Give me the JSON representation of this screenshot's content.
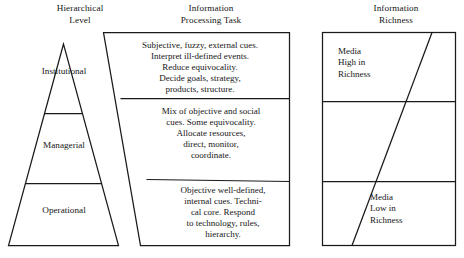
{
  "figure": {
    "columns": {
      "hierarchical_level": "Hierarchical\nLevel",
      "information_processing_task": "Information\nProcessing Task",
      "information_richness": "Information\nRichness"
    },
    "pyramid": {
      "levels": [
        {
          "label": "Institutional"
        },
        {
          "label": "Managerial"
        },
        {
          "label": "Operational"
        }
      ]
    },
    "processing_tasks": [
      {
        "level": "Institutional",
        "text": "Subjective, fuzzy, external cues.\nInterpret ill-defined events.\nReduce equivocality.\nDecide goals, strategy,\nproducts, structure."
      },
      {
        "level": "Managerial",
        "text": "Mix of objective and social\ncues. Some equivocality.\nAllocate resources,\ndirect, monitor,\ncoordinate."
      },
      {
        "level": "Operational",
        "text": "Objective well-defined,\ninternal cues. Techni-\ncal core. Respond\nto technology, rules,\nhierarchy."
      }
    ],
    "richness": [
      {
        "position": "top",
        "text": "Media\nHigh in\nRichness"
      },
      {
        "position": "bottom",
        "text": "Media\nLow in\nRichness"
      }
    ],
    "colors": {
      "line": "#1a1a1a",
      "background": "#ffffff",
      "text": "#161616"
    }
  }
}
